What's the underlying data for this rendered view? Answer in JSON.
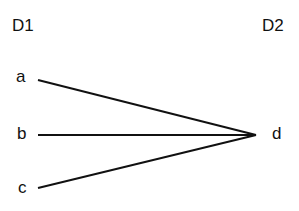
{
  "diagram": {
    "domains": [
      {
        "id": "D1",
        "label": "D1"
      },
      {
        "id": "D2",
        "label": "D2"
      }
    ],
    "nodes": [
      {
        "id": "a",
        "label": "a",
        "domain": "D1"
      },
      {
        "id": "b",
        "label": "b",
        "domain": "D1"
      },
      {
        "id": "c",
        "label": "c",
        "domain": "D1"
      },
      {
        "id": "d",
        "label": "d",
        "domain": "D2"
      }
    ],
    "edges": [
      {
        "from": "a",
        "to": "d"
      },
      {
        "from": "b",
        "to": "d"
      },
      {
        "from": "c",
        "to": "d"
      }
    ],
    "line_color": "#111111"
  }
}
